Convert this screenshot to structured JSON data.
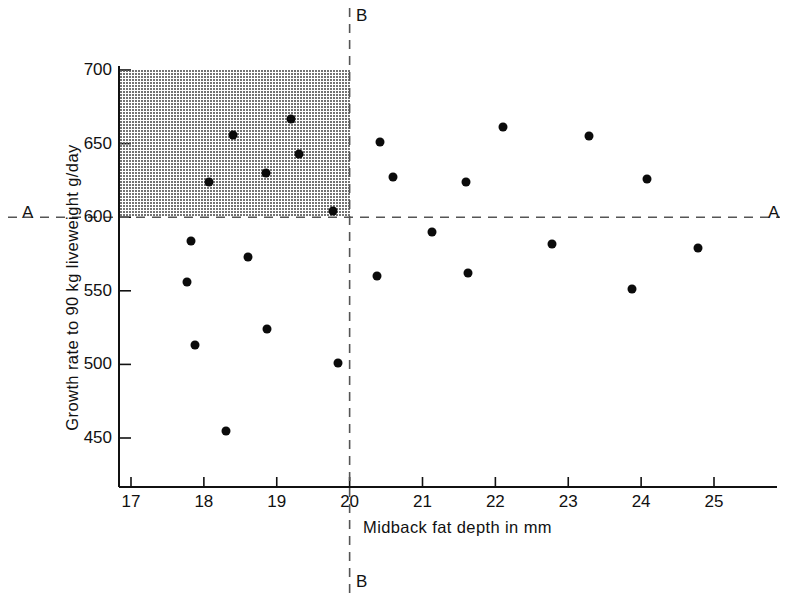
{
  "chart_data": {
    "type": "scatter",
    "title": "",
    "xlabel": "Midback fat depth in mm",
    "ylabel": "Growth rate to 90 kg liveweight g/day",
    "xlim": [
      16.83,
      25.86
    ],
    "ylim": [
      443,
      700
    ],
    "xticks": [
      17,
      18,
      19,
      20,
      21,
      22,
      23,
      24,
      25
    ],
    "yticks": [
      450,
      500,
      550,
      600,
      650,
      700
    ],
    "xtick_labels": [
      "17",
      "18",
      "19",
      "20",
      "21",
      "22",
      "23",
      "24",
      "25"
    ],
    "ytick_labels": [
      "450",
      "500",
      "550",
      "600",
      "650",
      "700"
    ],
    "grid": false,
    "legend": null,
    "points": [
      {
        "x": 17.77,
        "y": 556
      },
      {
        "x": 17.82,
        "y": 584
      },
      {
        "x": 17.88,
        "y": 513
      },
      {
        "x": 18.07,
        "y": 624
      },
      {
        "x": 18.3,
        "y": 455
      },
      {
        "x": 18.4,
        "y": 656
      },
      {
        "x": 18.6,
        "y": 573
      },
      {
        "x": 18.85,
        "y": 630
      },
      {
        "x": 18.86,
        "y": 524
      },
      {
        "x": 19.2,
        "y": 667
      },
      {
        "x": 19.3,
        "y": 643
      },
      {
        "x": 19.77,
        "y": 604
      },
      {
        "x": 19.84,
        "y": 501
      },
      {
        "x": 20.38,
        "y": 560
      },
      {
        "x": 20.42,
        "y": 651
      },
      {
        "x": 20.6,
        "y": 627
      },
      {
        "x": 21.13,
        "y": 590
      },
      {
        "x": 21.6,
        "y": 624
      },
      {
        "x": 21.62,
        "y": 562
      },
      {
        "x": 22.1,
        "y": 661
      },
      {
        "x": 22.78,
        "y": 582
      },
      {
        "x": 23.28,
        "y": 655
      },
      {
        "x": 23.88,
        "y": 551
      },
      {
        "x": 24.08,
        "y": 626
      },
      {
        "x": 24.78,
        "y": 579
      }
    ],
    "reference_lines": [
      {
        "id": "A",
        "orientation": "horizontal",
        "value": 600,
        "style": "dashed",
        "label_left": "A",
        "label_right": "A"
      },
      {
        "id": "B",
        "orientation": "vertical",
        "value": 20,
        "style": "dashed",
        "label_top": "B",
        "label_bottom": "B"
      }
    ],
    "shaded_region": {
      "x_from": 16.83,
      "x_to": 20,
      "y_from": 600,
      "y_to": 700,
      "fill": "stipple-gray",
      "color": "#5a5a5a"
    },
    "point_color": "#0b0b0b",
    "axis_color": "#111111"
  }
}
